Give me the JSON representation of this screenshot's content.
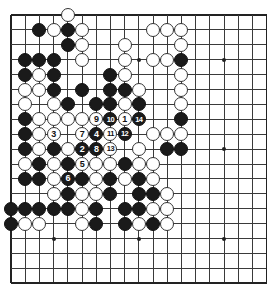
{
  "board": {
    "size": 19,
    "visible_rows": 19,
    "grid": {
      "left": 11,
      "top": 15,
      "dx": 14.2,
      "dy": 14.9
    },
    "colors": {
      "black": "#1a1a1a",
      "white": "#ffffff",
      "line": "#3a3a3a"
    },
    "star_points": [
      [
        3,
        3
      ],
      [
        3,
        9
      ],
      [
        3,
        15
      ],
      [
        9,
        3
      ],
      [
        9,
        9
      ],
      [
        9,
        15
      ],
      [
        15,
        3
      ],
      [
        15,
        9
      ],
      [
        15,
        15
      ]
    ],
    "first_move_color": "white"
  },
  "stones": [
    {
      "r": 0,
      "c": 4,
      "color": "white"
    },
    {
      "r": 1,
      "c": 2,
      "color": "black"
    },
    {
      "r": 1,
      "c": 3,
      "color": "white"
    },
    {
      "r": 1,
      "c": 4,
      "color": "black"
    },
    {
      "r": 1,
      "c": 5,
      "color": "white"
    },
    {
      "r": 1,
      "c": 10,
      "color": "white"
    },
    {
      "r": 1,
      "c": 11,
      "color": "white"
    },
    {
      "r": 1,
      "c": 12,
      "color": "white"
    },
    {
      "r": 2,
      "c": 4,
      "color": "black"
    },
    {
      "r": 2,
      "c": 5,
      "color": "white"
    },
    {
      "r": 2,
      "c": 8,
      "color": "white"
    },
    {
      "r": 2,
      "c": 12,
      "color": "white"
    },
    {
      "r": 3,
      "c": 1,
      "color": "black"
    },
    {
      "r": 3,
      "c": 2,
      "color": "black"
    },
    {
      "r": 3,
      "c": 3,
      "color": "black"
    },
    {
      "r": 3,
      "c": 5,
      "color": "white"
    },
    {
      "r": 3,
      "c": 8,
      "color": "white"
    },
    {
      "r": 3,
      "c": 10,
      "color": "white"
    },
    {
      "r": 3,
      "c": 11,
      "color": "white"
    },
    {
      "r": 3,
      "c": 12,
      "color": "black"
    },
    {
      "r": 4,
      "c": 1,
      "color": "black"
    },
    {
      "r": 4,
      "c": 2,
      "color": "white"
    },
    {
      "r": 4,
      "c": 3,
      "color": "black"
    },
    {
      "r": 4,
      "c": 7,
      "color": "black"
    },
    {
      "r": 4,
      "c": 8,
      "color": "white"
    },
    {
      "r": 4,
      "c": 12,
      "color": "white"
    },
    {
      "r": 5,
      "c": 1,
      "color": "white"
    },
    {
      "r": 5,
      "c": 2,
      "color": "white"
    },
    {
      "r": 5,
      "c": 3,
      "color": "black"
    },
    {
      "r": 5,
      "c": 5,
      "color": "black"
    },
    {
      "r": 5,
      "c": 7,
      "color": "black"
    },
    {
      "r": 5,
      "c": 8,
      "color": "black"
    },
    {
      "r": 5,
      "c": 9,
      "color": "white"
    },
    {
      "r": 5,
      "c": 12,
      "color": "white"
    },
    {
      "r": 6,
      "c": 1,
      "color": "white"
    },
    {
      "r": 6,
      "c": 3,
      "color": "white"
    },
    {
      "r": 6,
      "c": 4,
      "color": "black"
    },
    {
      "r": 6,
      "c": 6,
      "color": "black"
    },
    {
      "r": 6,
      "c": 7,
      "color": "black"
    },
    {
      "r": 6,
      "c": 8,
      "color": "white"
    },
    {
      "r": 6,
      "c": 9,
      "color": "black"
    },
    {
      "r": 6,
      "c": 12,
      "color": "white"
    },
    {
      "r": 7,
      "c": 1,
      "color": "black"
    },
    {
      "r": 7,
      "c": 2,
      "color": "white"
    },
    {
      "r": 7,
      "c": 3,
      "color": "white"
    },
    {
      "r": 7,
      "c": 4,
      "color": "white"
    },
    {
      "r": 7,
      "c": 5,
      "color": "white"
    },
    {
      "r": 7,
      "c": 6,
      "color": "white",
      "label": "9"
    },
    {
      "r": 7,
      "c": 7,
      "color": "black",
      "label": "10"
    },
    {
      "r": 7,
      "c": 8,
      "color": "white",
      "label": "1"
    },
    {
      "r": 7,
      "c": 9,
      "color": "black",
      "label": "14"
    },
    {
      "r": 7,
      "c": 12,
      "color": "black"
    },
    {
      "r": 8,
      "c": 1,
      "color": "black"
    },
    {
      "r": 8,
      "c": 2,
      "color": "white"
    },
    {
      "r": 8,
      "c": 3,
      "color": "white",
      "label": "3"
    },
    {
      "r": 8,
      "c": 5,
      "color": "white",
      "label": "7"
    },
    {
      "r": 8,
      "c": 6,
      "color": "black",
      "label": "4"
    },
    {
      "r": 8,
      "c": 7,
      "color": "white",
      "label": "11"
    },
    {
      "r": 8,
      "c": 8,
      "color": "black",
      "label": "12"
    },
    {
      "r": 8,
      "c": 10,
      "color": "white"
    },
    {
      "r": 8,
      "c": 11,
      "color": "white"
    },
    {
      "r": 8,
      "c": 12,
      "color": "white"
    },
    {
      "r": 9,
      "c": 1,
      "color": "black"
    },
    {
      "r": 9,
      "c": 2,
      "color": "white"
    },
    {
      "r": 9,
      "c": 3,
      "color": "black"
    },
    {
      "r": 9,
      "c": 4,
      "color": "white"
    },
    {
      "r": 9,
      "c": 5,
      "color": "black",
      "label": "2"
    },
    {
      "r": 9,
      "c": 6,
      "color": "black",
      "label": "8"
    },
    {
      "r": 9,
      "c": 7,
      "color": "white",
      "label": "13"
    },
    {
      "r": 9,
      "c": 9,
      "color": "white"
    },
    {
      "r": 9,
      "c": 11,
      "color": "black"
    },
    {
      "r": 9,
      "c": 12,
      "color": "black"
    },
    {
      "r": 10,
      "c": 1,
      "color": "white"
    },
    {
      "r": 10,
      "c": 2,
      "color": "black"
    },
    {
      "r": 10,
      "c": 3,
      "color": "white"
    },
    {
      "r": 10,
      "c": 4,
      "color": "black"
    },
    {
      "r": 10,
      "c": 5,
      "color": "white",
      "label": "5"
    },
    {
      "r": 10,
      "c": 6,
      "color": "white"
    },
    {
      "r": 10,
      "c": 7,
      "color": "white"
    },
    {
      "r": 10,
      "c": 8,
      "color": "black"
    },
    {
      "r": 10,
      "c": 9,
      "color": "white"
    },
    {
      "r": 10,
      "c": 10,
      "color": "white"
    },
    {
      "r": 11,
      "c": 1,
      "color": "black"
    },
    {
      "r": 11,
      "c": 2,
      "color": "black"
    },
    {
      "r": 11,
      "c": 3,
      "color": "white"
    },
    {
      "r": 11,
      "c": 4,
      "color": "black",
      "label": "6"
    },
    {
      "r": 11,
      "c": 5,
      "color": "black"
    },
    {
      "r": 11,
      "c": 6,
      "color": "white"
    },
    {
      "r": 11,
      "c": 7,
      "color": "black"
    },
    {
      "r": 11,
      "c": 8,
      "color": "white"
    },
    {
      "r": 11,
      "c": 9,
      "color": "black"
    },
    {
      "r": 11,
      "c": 10,
      "color": "white"
    },
    {
      "r": 12,
      "c": 3,
      "color": "white"
    },
    {
      "r": 12,
      "c": 4,
      "color": "black"
    },
    {
      "r": 12,
      "c": 5,
      "color": "white"
    },
    {
      "r": 12,
      "c": 6,
      "color": "white"
    },
    {
      "r": 12,
      "c": 7,
      "color": "black"
    },
    {
      "r": 12,
      "c": 9,
      "color": "black"
    },
    {
      "r": 12,
      "c": 10,
      "color": "black"
    },
    {
      "r": 12,
      "c": 11,
      "color": "white"
    },
    {
      "r": 13,
      "c": 0,
      "color": "black"
    },
    {
      "r": 13,
      "c": 1,
      "color": "black"
    },
    {
      "r": 13,
      "c": 2,
      "color": "black"
    },
    {
      "r": 13,
      "c": 3,
      "color": "black"
    },
    {
      "r": 13,
      "c": 4,
      "color": "black"
    },
    {
      "r": 13,
      "c": 5,
      "color": "white"
    },
    {
      "r": 13,
      "c": 6,
      "color": "black"
    },
    {
      "r": 13,
      "c": 8,
      "color": "black"
    },
    {
      "r": 13,
      "c": 9,
      "color": "black"
    },
    {
      "r": 13,
      "c": 10,
      "color": "white"
    },
    {
      "r": 13,
      "c": 11,
      "color": "white"
    },
    {
      "r": 14,
      "c": 0,
      "color": "black"
    },
    {
      "r": 14,
      "c": 1,
      "color": "white"
    },
    {
      "r": 14,
      "c": 2,
      "color": "white"
    },
    {
      "r": 14,
      "c": 5,
      "color": "white"
    },
    {
      "r": 14,
      "c": 6,
      "color": "black"
    },
    {
      "r": 14,
      "c": 8,
      "color": "black"
    },
    {
      "r": 14,
      "c": 9,
      "color": "white"
    },
    {
      "r": 14,
      "c": 10,
      "color": "black"
    },
    {
      "r": 14,
      "c": 11,
      "color": "white"
    }
  ]
}
